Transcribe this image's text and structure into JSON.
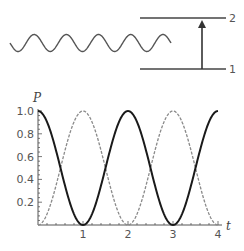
{
  "diagram": {
    "levels": [
      {
        "label": "2",
        "role": "upper-level"
      },
      {
        "label": "1",
        "role": "lower-level"
      }
    ],
    "wave": {
      "periods": 5,
      "description": "incident light wave"
    },
    "transition_arrow": {
      "from": "1",
      "to": "2"
    }
  },
  "chart_data": {
    "type": "line",
    "title": "",
    "xlabel": "t",
    "ylabel": "P",
    "xlim": [
      0,
      4
    ],
    "ylim": [
      0,
      1.0
    ],
    "x_ticks": [
      "1",
      "2",
      "3",
      "4"
    ],
    "y_ticks": [
      "0.2",
      "0.4",
      "0.6",
      "0.8",
      "1.0"
    ],
    "grid": false,
    "legend": null,
    "series": [
      {
        "name": "P1 (level 1 population)",
        "style": "solid black",
        "formula": "cos^2(pi*t/2)",
        "x": [
          0,
          0.5,
          1,
          1.5,
          2,
          2.5,
          3,
          3.5,
          4
        ],
        "values": [
          1.0,
          0.5,
          0.0,
          0.5,
          1.0,
          0.5,
          0.0,
          0.5,
          1.0
        ]
      },
      {
        "name": "P2 (level 2 population)",
        "style": "dashed gray",
        "formula": "sin^2(pi*t/2)",
        "x": [
          0,
          0.5,
          1,
          1.5,
          2,
          2.5,
          3,
          3.5,
          4
        ],
        "values": [
          0.0,
          0.5,
          1.0,
          0.5,
          0.0,
          0.5,
          1.0,
          0.5,
          0.0
        ]
      }
    ]
  },
  "colors": {
    "solid": "#1a1a1a",
    "dashed": "#8a8a8a",
    "axis": "#555555",
    "lines": "#444444"
  }
}
